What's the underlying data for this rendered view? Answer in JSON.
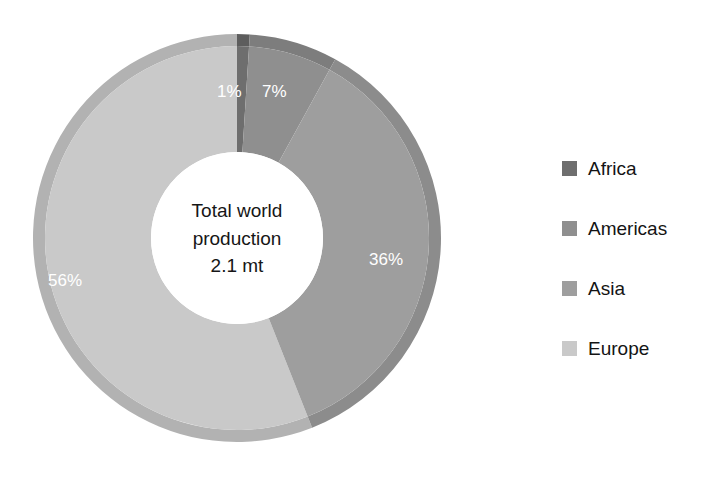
{
  "chart_data": {
    "type": "pie",
    "variant": "donut",
    "title": "",
    "subtitle": "",
    "xlabel": "",
    "ylabel": "",
    "legend_position": "right",
    "grid": false,
    "start_angle_deg": 0,
    "direction": "clockwise",
    "categories": [
      "Africa",
      "Americas",
      "Asia",
      "Europe"
    ],
    "values": [
      1,
      7,
      36,
      56
    ],
    "value_unit": "%",
    "data_labels": [
      "1%",
      "7%",
      "36%",
      "56%"
    ],
    "colors": [
      "#6e6e6e",
      "#8f8f8f",
      "#9e9e9e",
      "#c9c9c9"
    ],
    "rim_colors": [
      "#5d5d5d",
      "#7d7d7d",
      "#8c8c8c",
      "#b2b2b2"
    ],
    "slices": [
      {
        "name": "Africa",
        "value": 1,
        "label": "1%",
        "color": "#6e6e6e",
        "rim": "#5d5d5d"
      },
      {
        "name": "Americas",
        "value": 7,
        "label": "7%",
        "color": "#8f8f8f",
        "rim": "#7d7d7d"
      },
      {
        "name": "Asia",
        "value": 36,
        "label": "36%",
        "color": "#9e9e9e",
        "rim": "#8c8c8c"
      },
      {
        "name": "Europe",
        "value": 56,
        "label": "56%",
        "color": "#c9c9c9",
        "rim": "#b2b2b2"
      }
    ],
    "annotations": [
      "Total world production",
      "2.1 mt"
    ]
  },
  "center": {
    "line1": "Total world",
    "line2": "production",
    "line3": "2.1 mt"
  },
  "labels": {
    "africa": "1%",
    "americas": "7%",
    "asia": "36%",
    "europe": "56%"
  },
  "legend": {
    "items": [
      {
        "label": "Africa",
        "color": "#6e6e6e"
      },
      {
        "label": "Americas",
        "color": "#8f8f8f"
      },
      {
        "label": "Asia",
        "color": "#9e9e9e"
      },
      {
        "label": "Europe",
        "color": "#c9c9c9"
      }
    ]
  }
}
